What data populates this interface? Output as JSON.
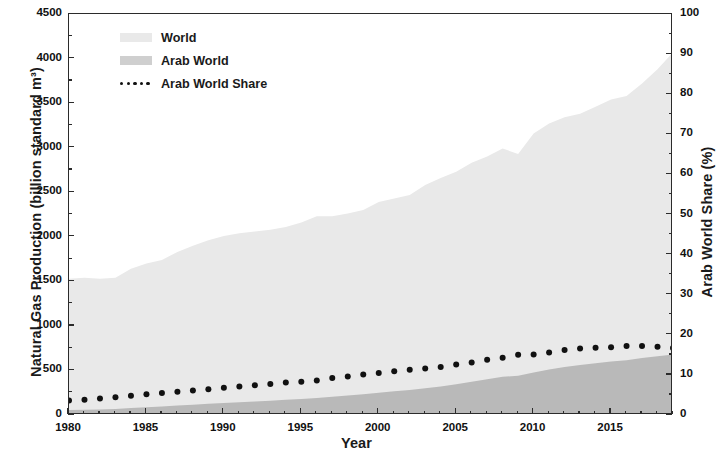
{
  "chart_data": {
    "type": "area",
    "title": "",
    "xlabel": "Year",
    "ylabel": "Natural Gas Production (billion standard m³)",
    "ylabel_right": "Arab World Share (%)",
    "xlim": [
      1980,
      2019
    ],
    "ylim": [
      0,
      4500
    ],
    "ylim_right": [
      0,
      100
    ],
    "grid": false,
    "legend_position": "top-left",
    "xticks": [
      1980,
      1985,
      1990,
      1995,
      2000,
      2005,
      2010,
      2015
    ],
    "xtick_labels": [
      "1980",
      "1985",
      "1990",
      "1995",
      "2000",
      "2005",
      "2010",
      "2015"
    ],
    "xminor_step": 1,
    "yticks": [
      0,
      500,
      1000,
      1500,
      2000,
      2500,
      3000,
      3500,
      4000,
      4500
    ],
    "ytick_labels": [
      "0",
      "500",
      "1000",
      "1500",
      "2000",
      "2500",
      "3000",
      "3500",
      "4000",
      "4500"
    ],
    "yticks_right": [
      0,
      10,
      20,
      30,
      40,
      50,
      60,
      70,
      80,
      90,
      100
    ],
    "ytick_labels_right": [
      "0",
      "10",
      "20",
      "30",
      "40",
      "50",
      "60",
      "70",
      "80",
      "90",
      "100"
    ],
    "x": [
      1980,
      1981,
      1982,
      1983,
      1984,
      1985,
      1986,
      1987,
      1988,
      1989,
      1990,
      1991,
      1992,
      1993,
      1994,
      1995,
      1996,
      1997,
      1998,
      1999,
      2000,
      2001,
      2002,
      2003,
      2004,
      2005,
      2006,
      2007,
      2008,
      2009,
      2010,
      2011,
      2012,
      2013,
      2014,
      2015,
      2016,
      2017,
      2018,
      2019
    ],
    "series": [
      {
        "name": "World",
        "kind": "area",
        "axis": "left",
        "color": "#e9e9e9",
        "units": "billion standard m³",
        "values": [
          1530,
          1540,
          1530,
          1540,
          1640,
          1700,
          1740,
          1830,
          1900,
          1960,
          2010,
          2040,
          2060,
          2080,
          2110,
          2160,
          2230,
          2230,
          2260,
          2300,
          2390,
          2430,
          2470,
          2580,
          2660,
          2730,
          2830,
          2900,
          2990,
          2930,
          3160,
          3270,
          3340,
          3380,
          3460,
          3540,
          3580,
          3720,
          3880,
          4070
        ]
      },
      {
        "name": "Arab World",
        "kind": "area",
        "axis": "left",
        "color": "#b9b9b9",
        "units": "billion standard m³",
        "values": [
          55,
          58,
          62,
          68,
          78,
          88,
          96,
          106,
          116,
          126,
          136,
          144,
          152,
          160,
          170,
          180,
          192,
          205,
          218,
          232,
          250,
          266,
          280,
          300,
          320,
          345,
          372,
          400,
          428,
          440,
          478,
          510,
          540,
          560,
          580,
          600,
          615,
          640,
          660,
          680
        ]
      },
      {
        "name": "Arab World Share",
        "kind": "dotted-line",
        "axis": "right",
        "color": "#111111",
        "units": "%",
        "values": [
          3.6,
          3.8,
          4.1,
          4.4,
          4.8,
          5.2,
          5.5,
          5.8,
          6.1,
          6.4,
          6.8,
          7.1,
          7.4,
          7.7,
          8.1,
          8.3,
          8.6,
          9.2,
          9.6,
          10.1,
          10.5,
          10.9,
          11.3,
          11.6,
          12.0,
          12.6,
          13.1,
          13.8,
          14.3,
          15.0,
          15.1,
          15.6,
          16.2,
          16.6,
          16.8,
          16.9,
          17.2,
          17.2,
          17.0,
          16.7
        ]
      }
    ]
  },
  "legend": {
    "items": [
      {
        "label": "World",
        "marker": "area-swatch-light"
      },
      {
        "label": "Arab World",
        "marker": "area-swatch-mid"
      },
      {
        "label": "Arab World Share",
        "marker": "dotted-line"
      }
    ]
  }
}
